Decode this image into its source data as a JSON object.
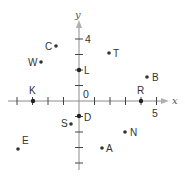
{
  "diagram": {
    "type": "coordinate-plane",
    "axes": {
      "x_label": "x",
      "y_label": "y",
      "origin_label": "0",
      "x_tick_label": "5",
      "y_tick_label": "4",
      "x_range": [
        -4,
        5
      ],
      "y_range": [
        -4,
        4
      ],
      "unit_px": 15.5,
      "origin_px": [
        79,
        101
      ]
    },
    "points": [
      {
        "name": "C",
        "label_side": "left",
        "x": -1.5,
        "y": 3.5,
        "on_axis": false
      },
      {
        "name": "W",
        "label_side": "left",
        "x": -2.4,
        "y": 2.4,
        "on_axis": false
      },
      {
        "name": "T",
        "label_side": "right",
        "x": 1.9,
        "y": 3.1,
        "on_axis": false
      },
      {
        "name": "L",
        "label_side": "right",
        "x": 0,
        "y": 2,
        "on_axis": true
      },
      {
        "name": "B",
        "label_side": "right",
        "x": 4.4,
        "y": 1.5,
        "on_axis": false
      },
      {
        "name": "K",
        "label_side": "above",
        "x": -3,
        "y": 0,
        "on_axis": true
      },
      {
        "name": "R",
        "label_side": "above",
        "x": 4,
        "y": 0,
        "on_axis": true
      },
      {
        "name": "D",
        "label_side": "right",
        "x": 0,
        "y": -1,
        "on_axis": true
      },
      {
        "name": "S",
        "label_side": "left",
        "x": -0.5,
        "y": -1.5,
        "on_axis": false
      },
      {
        "name": "N",
        "label_side": "right",
        "x": 3,
        "y": -2,
        "on_axis": false
      },
      {
        "name": "A",
        "label_side": "right",
        "x": 1.5,
        "y": -3,
        "on_axis": false
      },
      {
        "name": "E",
        "label_side": "above-right",
        "x": -4,
        "y": -3.1,
        "on_axis": false
      }
    ]
  },
  "colors": {
    "axis": "#8c8c8c",
    "point": "#333333",
    "text": "#333333"
  }
}
